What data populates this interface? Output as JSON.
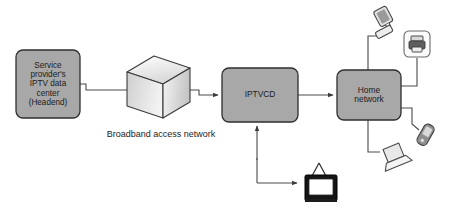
{
  "diagram": {
    "type": "network-architecture",
    "background_color": "#ffffff",
    "node_fill_color": "#a8a8a8",
    "node_stroke_color": "#3a3a3a",
    "line_color": "#4a4a4a",
    "text_color": "#1c1c1c"
  },
  "nodes": {
    "headend": {
      "label": "Service\nprovider's\nIPTV data\ncenter\n(Headend)",
      "shape": "rounded-rectangle"
    },
    "broadband": {
      "label": "Broadband access network",
      "shape": "3d-cube",
      "caption_position": "below"
    },
    "iptvcd": {
      "label": "IPTVCD",
      "shape": "rounded-rectangle"
    },
    "home_network": {
      "label": "Home\nnetwork",
      "shape": "rounded-rectangle"
    }
  },
  "devices": [
    {
      "name": "desktop-computer",
      "icon": "desktop-computer-icon",
      "position": "top-right"
    },
    {
      "name": "printer",
      "icon": "printer-icon",
      "position": "top-far-right"
    },
    {
      "name": "mobile-phone",
      "icon": "mobile-phone-icon",
      "position": "bottom-far-right"
    },
    {
      "name": "laptop",
      "icon": "laptop-icon",
      "position": "bottom-right"
    },
    {
      "name": "television",
      "icon": "television-icon",
      "position": "bottom-center"
    }
  ],
  "connections": [
    {
      "from": "headend",
      "to": "broadband",
      "arrow": "end"
    },
    {
      "from": "broadband",
      "to": "iptvcd",
      "arrow": "end"
    },
    {
      "from": "iptvcd",
      "to": "home_network",
      "arrow": "end"
    },
    {
      "from": "iptvcd",
      "to": "television",
      "arrow": "both"
    },
    {
      "from": "home_network",
      "to": "desktop-computer",
      "arrow": "none"
    },
    {
      "from": "home_network",
      "to": "printer",
      "arrow": "none"
    },
    {
      "from": "home_network",
      "to": "mobile-phone",
      "arrow": "none"
    },
    {
      "from": "home_network",
      "to": "laptop",
      "arrow": "none"
    }
  ]
}
